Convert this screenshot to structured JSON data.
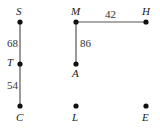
{
  "diagram": {
    "type": "graph",
    "nodes": [
      {
        "id": "S",
        "label": "S",
        "x": 20,
        "y": 22,
        "label_pos": "above"
      },
      {
        "id": "T",
        "label": "T",
        "x": 20,
        "y": 64,
        "label_pos": "left"
      },
      {
        "id": "C",
        "label": "C",
        "x": 20,
        "y": 106,
        "label_pos": "below"
      },
      {
        "id": "M",
        "label": "M",
        "x": 76,
        "y": 22,
        "label_pos": "above"
      },
      {
        "id": "A",
        "label": "A",
        "x": 76,
        "y": 64,
        "label_pos": "below"
      },
      {
        "id": "L",
        "label": "L",
        "x": 76,
        "y": 106,
        "label_pos": "below"
      },
      {
        "id": "H",
        "label": "H",
        "x": 146,
        "y": 22,
        "label_pos": "above"
      },
      {
        "id": "E",
        "label": "E",
        "x": 146,
        "y": 106,
        "label_pos": "below"
      }
    ],
    "edges": [
      {
        "from": "S",
        "to": "T",
        "weight": "68"
      },
      {
        "from": "T",
        "to": "C",
        "weight": "54"
      },
      {
        "from": "M",
        "to": "A",
        "weight": "86"
      },
      {
        "from": "M",
        "to": "H",
        "weight": "42"
      }
    ]
  }
}
